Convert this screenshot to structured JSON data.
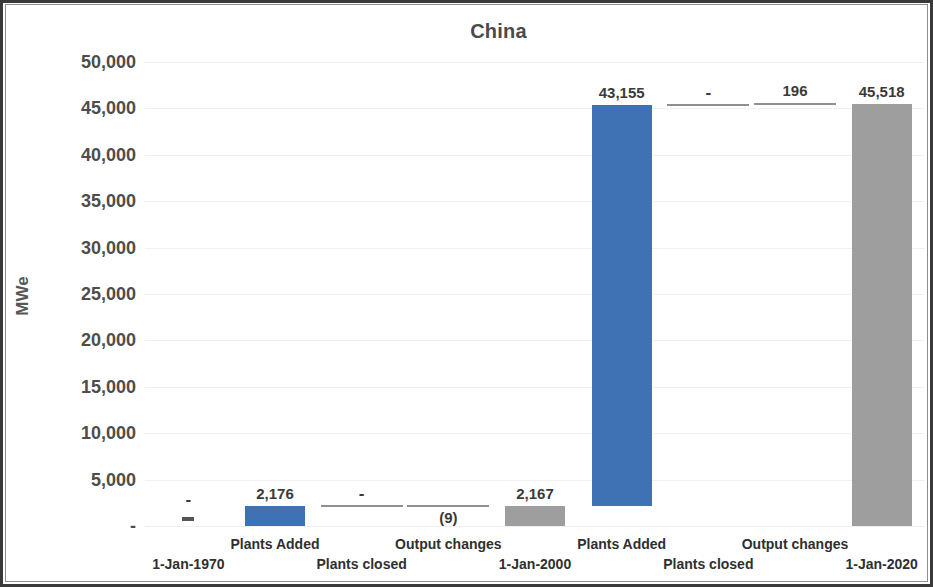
{
  "chart_data": {
    "type": "bar",
    "subtype": "waterfall",
    "title": "China",
    "xlabel": "",
    "ylabel": "MWe",
    "ylim": [
      0,
      50000
    ],
    "ytick_labels": [
      "50,000",
      "45,000",
      "40,000",
      "35,000",
      "30,000",
      "25,000",
      "20,000",
      "15,000",
      "10,000",
      "5,000",
      "-"
    ],
    "ytick_values": [
      50000,
      45000,
      40000,
      35000,
      30000,
      25000,
      20000,
      15000,
      10000,
      5000,
      0
    ],
    "grid": true,
    "legend": "none",
    "categories": [
      "1-Jan-1970",
      "Plants Added",
      "Plants closed",
      "Output changes",
      "1-Jan-2000",
      "Plants Added",
      "Plants closed",
      "Output changes",
      "1-Jan-2020"
    ],
    "values": [
      0,
      2176,
      0,
      -9,
      2167,
      43155,
      0,
      196,
      45518
    ],
    "cumulative_base": [
      0,
      0,
      2176,
      2176,
      0,
      2167,
      45322,
      45322,
      0
    ],
    "cumulative_top": [
      0,
      2176,
      2176,
      2167,
      2167,
      45322,
      45322,
      45518,
      45518
    ],
    "data_labels": [
      "-",
      "2,176",
      "-",
      "(9)",
      "2,167",
      "43,155",
      "-",
      "196",
      "45,518"
    ],
    "bar_kinds": [
      "total",
      "increase",
      "zero",
      "decrease",
      "total",
      "increase",
      "zero",
      "increase",
      "total"
    ],
    "colors": {
      "increase": "#3F72B5",
      "total": "#9E9E9E",
      "zero": "#6B6B6B",
      "axis_text": "#4D4D4D",
      "title_text": "#4A4A4A",
      "category_text": "#2F2F2F",
      "gridline": "#F1F1F1",
      "frame": "#3A3A3A",
      "background": "#FFFFFF"
    }
  }
}
